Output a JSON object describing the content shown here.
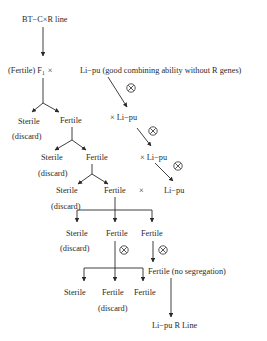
{
  "diagram": {
    "title_node": "BT−C×R line",
    "f1_label_prefix": "(Fertile) F",
    "f1_subscript": "1",
    "f1_cross": "×",
    "donor": "Li−pu (good combining ability without R genes)",
    "gen1": {
      "sterile": "Sterile",
      "sterile_note": "(discard)",
      "fertile": "Fertile",
      "backcross": "× Li−pu"
    },
    "gen2": {
      "sterile": "Sterile",
      "sterile_note": "(discard)",
      "fertile": "Fertile",
      "backcross": "× Li−pu"
    },
    "gen3": {
      "sterile": "Sterile",
      "sterile_note": "(discard)",
      "fertile": "Fertile",
      "cross": "×",
      "parent": "Li−pu"
    },
    "gen4": {
      "sterile": "Sterile",
      "sterile_note": "(discard)",
      "fertile_a": "Fertile",
      "fertile_b": "Fertile"
    },
    "gen5": {
      "sterile": "Sterile",
      "fertile_a": "Fertile",
      "fertile_a_note": "(discard)",
      "fertile_b": "Fertile",
      "no_segregation": "Fertile (no segregation)"
    },
    "final": "Li−pu R Line",
    "selfing_symbol": "selfing-circle-x-icon"
  }
}
